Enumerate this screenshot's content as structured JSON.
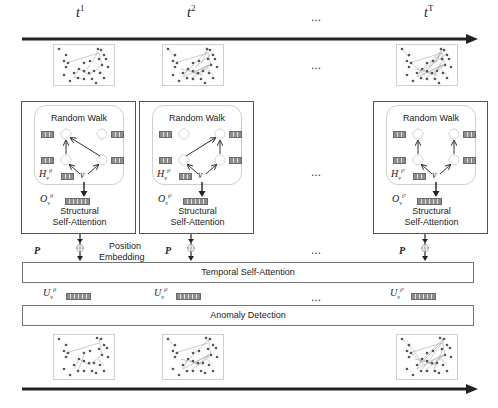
{
  "timeline": {
    "labels": [
      {
        "base": "t",
        "sup": "1"
      },
      {
        "base": "t",
        "sup": "2"
      },
      {
        "base": "t",
        "sup": "T"
      }
    ],
    "ellipsis": "..."
  },
  "snapshots": {
    "count_visible": 3,
    "ellipsis": "..."
  },
  "structural_blocks": [
    {
      "random_walk_title": "Random Walk",
      "hidden_symbol": {
        "base": "H",
        "sub": "v",
        "sup": "t1"
      },
      "hidden_sup_display": "t¹",
      "node_symbol": "v",
      "output_symbol": {
        "base": "O",
        "sub": "v",
        "sup": "t1"
      },
      "output_sup_display": "t¹",
      "label_line1": "Structural",
      "label_line2": "Self-Attention"
    },
    {
      "random_walk_title": "Random Walk",
      "hidden_symbol": {
        "base": "H",
        "sub": "v",
        "sup": "t2"
      },
      "hidden_sup_display": "t²",
      "node_symbol": "v",
      "output_symbol": {
        "base": "O",
        "sub": "v",
        "sup": "t2"
      },
      "output_sup_display": "t²",
      "label_line1": "Structural",
      "label_line2": "Self-Attention"
    },
    {
      "random_walk_title": "Random Walk",
      "hidden_symbol": {
        "base": "H",
        "sub": "v",
        "sup": "tT"
      },
      "hidden_sup_display": "tᵀ",
      "node_symbol": "v",
      "output_symbol": {
        "base": "O",
        "sub": "v",
        "sup": "tT"
      },
      "output_sup_display": "tᵀ",
      "label_line1": "Structural",
      "label_line2": "Self-Attention"
    }
  ],
  "middle_ellipsis": "...",
  "position_embedding": {
    "p_symbol": "P",
    "plus_symbol": "⊕",
    "label_line1": "Position",
    "label_line2": "Embedding",
    "ellipsis": "..."
  },
  "temporal_self_attention": {
    "label": "Temporal Self-Attention"
  },
  "outputs": {
    "items": [
      {
        "base": "U",
        "sub": "v",
        "sup_display": "t¹"
      },
      {
        "base": "U",
        "sub": "v",
        "sup_display": "t²"
      },
      {
        "base": "U",
        "sub": "v",
        "sup_display": "tᵀ"
      }
    ],
    "ellipsis": "..."
  },
  "anomaly_detection": {
    "label": "Anomaly Detection"
  },
  "colors": {
    "arrow": "#222222",
    "frame_border": "#555555",
    "vector_fill": "#8c8c8c",
    "thumb_border": "#cfcfcf"
  }
}
